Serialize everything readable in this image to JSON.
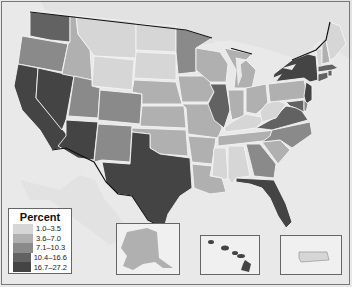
{
  "legend": {
    "title": "Percent",
    "items": [
      {
        "label": "1.0–3.5",
        "color": "#d6d6d6"
      },
      {
        "label": "3.6–7.0",
        "color": "#b0b0b0"
      },
      {
        "label": "7.1–10.3",
        "color": "#8a8a8a"
      },
      {
        "label": "10.4–16.6",
        "color": "#626262"
      },
      {
        "label": "16.7–27.2",
        "color": "#444444"
      }
    ]
  },
  "colors": {
    "ocean": "#e9e9e9",
    "foreign_land": "#e4e4e4",
    "state_border": "#f4f4f4",
    "national_border": "#111111"
  },
  "insets": [
    {
      "name": "Alaska",
      "class": "3.6–7.0"
    },
    {
      "name": "Hawaii",
      "class": "16.7–27.2"
    },
    {
      "name": "Puerto Rico",
      "class": "1.0–3.5"
    }
  ],
  "states": {
    "WA": "10.4–16.6",
    "OR": "7.1–10.3",
    "CA": "16.7–27.2",
    "NV": "16.7–27.2",
    "ID": "3.6–7.0",
    "MT": "1.0–3.5",
    "WY": "1.0–3.5",
    "UT": "7.1–10.3",
    "AZ": "16.7–27.2",
    "CO": "7.1–10.3",
    "NM": "7.1–10.3",
    "ND": "1.0–3.5",
    "SD": "1.0–3.5",
    "NE": "3.6–7.0",
    "KS": "3.6–7.0",
    "OK": "3.6–7.0",
    "TX": "16.7–27.2",
    "MN": "7.1–10.3",
    "IA": "3.6–7.0",
    "MO": "3.6–7.0",
    "AR": "3.6–7.0",
    "LA": "3.6–7.0",
    "WI": "3.6–7.0",
    "IL": "10.4–16.6",
    "MI": "3.6–7.0",
    "IN": "3.6–7.0",
    "OH": "3.6–7.0",
    "KY": "1.0–3.5",
    "TN": "3.6–7.0",
    "MS": "1.0–3.5",
    "AL": "1.0–3.5",
    "GA": "7.1–10.3",
    "FL": "16.7–27.2",
    "SC": "3.6–7.0",
    "NC": "7.1–10.3",
    "VA": "10.4–16.6",
    "WV": "1.0–3.5",
    "PA": "3.6–7.0",
    "NY": "16.7–27.2",
    "NJ": "16.7–27.2",
    "MD": "10.4–16.6",
    "DE": "7.1–10.3",
    "CT": "10.4–16.6",
    "RI": "10.4–16.6",
    "MA": "10.4–16.6",
    "VT": "1.0–3.5",
    "NH": "3.6–7.0",
    "ME": "1.0–3.5"
  }
}
